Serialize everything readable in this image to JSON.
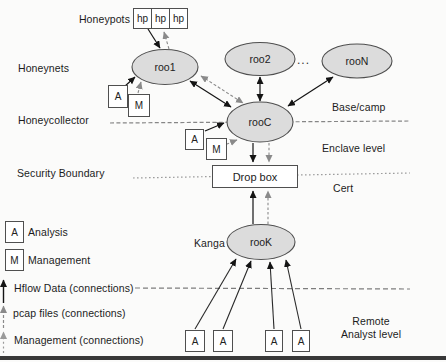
{
  "diagram": {
    "title_context": "Honeynet data collection architecture",
    "letters": {
      "A": "A",
      "M": "M",
      "hp": "hp"
    },
    "nodes": {
      "roo1": "roo1",
      "roo2": "roo2",
      "rooN": "rooN",
      "rooC": "rooC",
      "rooK": "rooK",
      "dropbox": "Drop box",
      "ellipsis": "..."
    },
    "left_labels": {
      "honeypots": "Honeypots",
      "honeynets": "Honeynets",
      "honeycollector": "Honeycollector",
      "security_boundary": "Security Boundary",
      "kanga": "Kanga"
    },
    "right_labels": {
      "base_camp": "Base/camp",
      "enclave_level": "Enclave level",
      "cert": "Cert",
      "remote_line1": "Remote",
      "remote_line2": "Analyst level"
    },
    "legend": {
      "analysis_letter": "A",
      "analysis_label": "Analysis",
      "management_letter": "M",
      "management_label": "Management",
      "hflow_label": "Hflow Data (connections)",
      "pcap_label": "pcap files (connections)",
      "management_conn_label": "Management (connections)"
    },
    "colors": {
      "node_fill": "#dcdcdc",
      "node_stroke": "#4f4f4f",
      "solid_arrow": "#141414",
      "dashed_arrow": "#8a8a8a",
      "light_dashed_arrow": "#9a9a9a",
      "boundary_dash": "#868686",
      "security_dash": "#9c9c9c",
      "bottom_bar": "#383838"
    }
  }
}
